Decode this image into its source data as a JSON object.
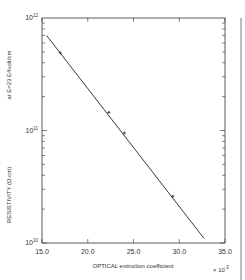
{
  "chart_data": {
    "type": "line",
    "title": "",
    "xlabel": "OPTICAL extinction coefficient",
    "x_multiplier": "× 10^-3",
    "ylabel": "RESISTIVITY (Ω.cm)",
    "annotation": "at E=23 E4volt/cm",
    "yscale": "log",
    "xlim": [
      15.0,
      35.0
    ],
    "ylim": [
      10000000000.0,
      1000000000000.0
    ],
    "x_ticks": [
      "15.0",
      "20.0",
      "25.0",
      "30.0",
      "35.0"
    ],
    "y_ticks": [
      {
        "base": "10",
        "exp": "10"
      },
      {
        "base": "10",
        "exp": "11"
      },
      {
        "base": "10",
        "exp": "12"
      }
    ],
    "grid": false,
    "series": [
      {
        "name": "fit line",
        "x": [
          15.5,
          32.7
        ],
        "y": [
          700000000000.0,
          11000000000.0
        ]
      },
      {
        "name": "measured points",
        "x": [
          17.0,
          22.3,
          24.0,
          29.3
        ],
        "y": [
          490000000000.0,
          145000000000.0,
          95000000000.0,
          26000000000.0
        ]
      }
    ]
  },
  "frame": {
    "left": 42,
    "right": 225,
    "top": 18,
    "bottom": 243
  },
  "colors": {
    "axis": "#333333",
    "line": "#222222",
    "background": "#ffffff"
  }
}
